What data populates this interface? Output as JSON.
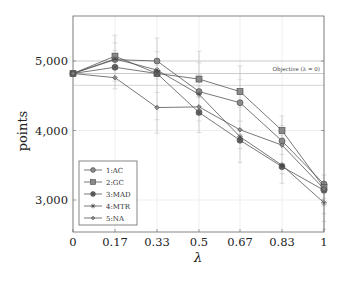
{
  "chart_data": {
    "type": "line",
    "title": "",
    "xlabel": "λ",
    "ylabel": "points",
    "x": [
      0,
      0.17,
      0.33,
      0.5,
      0.67,
      0.83,
      1
    ],
    "x_tick_labels": [
      "0",
      "0.17",
      "0.33",
      "0.5",
      "0.67",
      "0.83",
      "1"
    ],
    "y_ticks": [
      3000,
      4000,
      5000
    ],
    "y_tick_labels": [
      "3,000",
      "4,000",
      "5,000"
    ],
    "ylim": [
      2530,
      5650
    ],
    "grid": true,
    "legend_position": "lower left",
    "series": [
      {
        "name": "1:AC",
        "marker": "circle",
        "values": [
          4820,
          5020,
          5000,
          4560,
          4400,
          3850,
          3230
        ]
      },
      {
        "name": "2:GC",
        "marker": "square",
        "values": [
          4820,
          5070,
          4820,
          4740,
          4560,
          4000,
          3180
        ]
      },
      {
        "name": "3:MAD",
        "marker": "circle-cross",
        "values": [
          4820,
          4910,
          4820,
          4260,
          3860,
          3480,
          3140
        ]
      },
      {
        "name": "4:MTR",
        "marker": "star",
        "values": [
          4820,
          5030,
          4870,
          4520,
          3910,
          3500,
          2960
        ]
      },
      {
        "name": "5:NA",
        "marker": "diamond",
        "values": [
          4820,
          4760,
          4330,
          4340,
          4010,
          3790,
          3160
        ]
      }
    ],
    "error_bars": {
      "x": [
        0,
        0.17,
        0.33,
        0.5,
        0.67,
        0.83,
        1
      ],
      "upper": [
        4820,
        5370,
        5330,
        5140,
        4930,
        4210,
        3360
      ],
      "lower": [
        4820,
        4600,
        3960,
        3970,
        3540,
        3240,
        2580
      ]
    },
    "annotations": [
      {
        "text": "Objective (λ = 0)",
        "type": "horizontal_band",
        "center": 4820,
        "upper": 5000,
        "lower": 4650
      }
    ]
  },
  "legend": {
    "items": [
      {
        "label": "1:AC"
      },
      {
        "label": "2:GC"
      },
      {
        "label": "3:MAD"
      },
      {
        "label": "4:MTR"
      },
      {
        "label": "5:NA"
      }
    ]
  },
  "annotation": {
    "objective_label": "Objective (λ = 0)"
  },
  "axes": {
    "xlabel": "λ",
    "ylabel": "points"
  },
  "colors": {
    "line": "#555555",
    "marker_fill": "#8a8a8a",
    "marker_stroke": "#444444",
    "grid": "#dddddd",
    "frame": "#666666",
    "errorbar": "#c8c8c8"
  }
}
